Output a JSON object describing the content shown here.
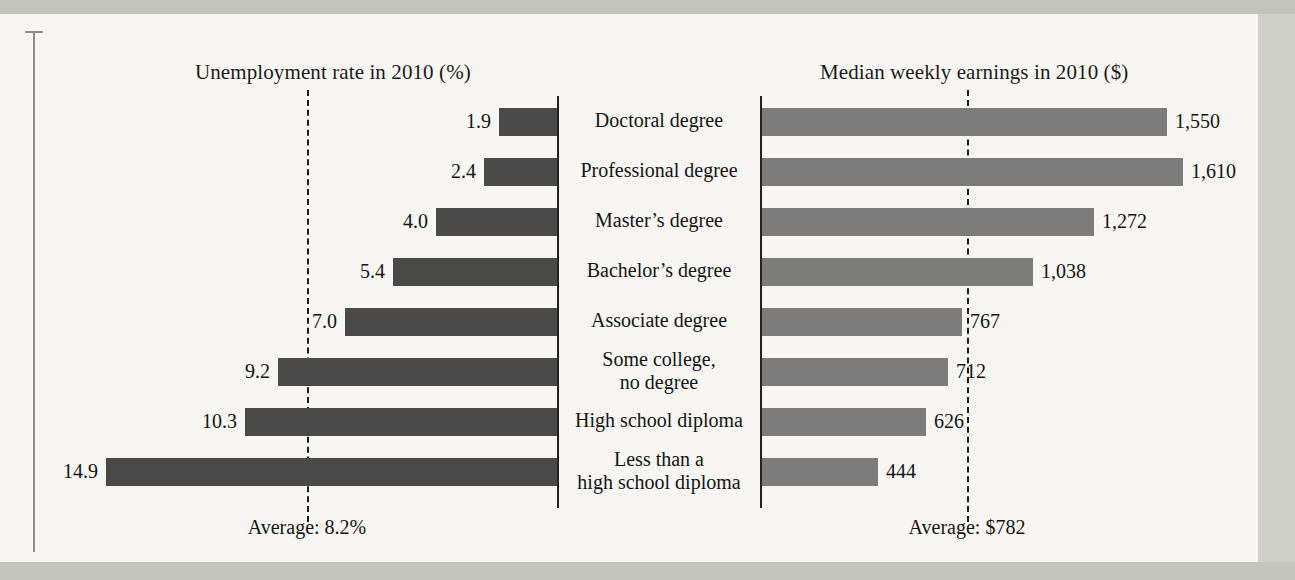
{
  "figure": {
    "background_color": "#f7f6f2",
    "left_bar_color": "#4a4a4a",
    "right_bar_color": "#7c7c7c"
  },
  "left_panel": {
    "title": "Unemployment rate in 2010 (%)",
    "average_label": "Average: 8.2%",
    "average_value": 8.2
  },
  "right_panel": {
    "title": "Median weekly earnings in 2010 ($)",
    "average_label": "Average: $782",
    "average_value": 782
  },
  "rows": [
    {
      "category": "Doctoral degree",
      "lines": [
        "Doctoral degree"
      ],
      "unemployment": 1.9,
      "unemployment_label": "1.9",
      "earnings": 1550,
      "earnings_label": "1,550"
    },
    {
      "category": "Professional degree",
      "lines": [
        "Professional degree"
      ],
      "unemployment": 2.4,
      "unemployment_label": "2.4",
      "earnings": 1610,
      "earnings_label": "1,610"
    },
    {
      "category": "Master's degree",
      "lines": [
        "Master’s degree"
      ],
      "unemployment": 4.0,
      "unemployment_label": "4.0",
      "earnings": 1272,
      "earnings_label": "1,272"
    },
    {
      "category": "Bachelor's degree",
      "lines": [
        "Bachelor’s degree"
      ],
      "unemployment": 5.4,
      "unemployment_label": "5.4",
      "earnings": 1038,
      "earnings_label": "1,038"
    },
    {
      "category": "Associate degree",
      "lines": [
        "Associate degree"
      ],
      "unemployment": 7.0,
      "unemployment_label": "7.0",
      "earnings": 767,
      "earnings_label": "767"
    },
    {
      "category": "Some college, no degree",
      "lines": [
        "Some college,",
        "no degree"
      ],
      "unemployment": 9.2,
      "unemployment_label": "9.2",
      "earnings": 712,
      "earnings_label": "712"
    },
    {
      "category": "High school diploma",
      "lines": [
        "High school diploma"
      ],
      "unemployment": 10.3,
      "unemployment_label": "10.3",
      "earnings": 626,
      "earnings_label": "626"
    },
    {
      "category": "Less than a high school diploma",
      "lines": [
        "Less than a",
        "high school diploma"
      ],
      "unemployment": 14.9,
      "unemployment_label": "14.9",
      "earnings": 444,
      "earnings_label": "444"
    }
  ],
  "chart_data": {
    "type": "bar",
    "orientation": "horizontal",
    "layout": "back-to-back dual panel, shared centered category labels",
    "categories": [
      "Doctoral degree",
      "Professional degree",
      "Master's degree",
      "Bachelor's degree",
      "Associate degree",
      "Some college, no degree",
      "High school diploma",
      "Less than a high school diploma"
    ],
    "series": [
      {
        "name": "Unemployment rate in 2010 (%)",
        "panel": "left",
        "direction": "right-to-left",
        "unit": "%",
        "color": "#4a4a4a",
        "values": [
          1.9,
          2.4,
          4.0,
          5.4,
          7.0,
          9.2,
          10.3,
          14.9
        ],
        "reference_line": {
          "label": "Average: 8.2%",
          "value": 8.2,
          "style": "dashed"
        },
        "axis_range": [
          0,
          16
        ]
      },
      {
        "name": "Median weekly earnings in 2010 ($)",
        "panel": "right",
        "direction": "left-to-right",
        "unit": "$",
        "color": "#7c7c7c",
        "values": [
          1550,
          1610,
          1272,
          1038,
          767,
          712,
          626,
          444
        ],
        "reference_line": {
          "label": "Average: $782",
          "value": 782,
          "style": "dashed"
        },
        "axis_range": [
          0,
          1700
        ]
      }
    ],
    "grid": false,
    "legend": "none",
    "data_labels": true
  }
}
